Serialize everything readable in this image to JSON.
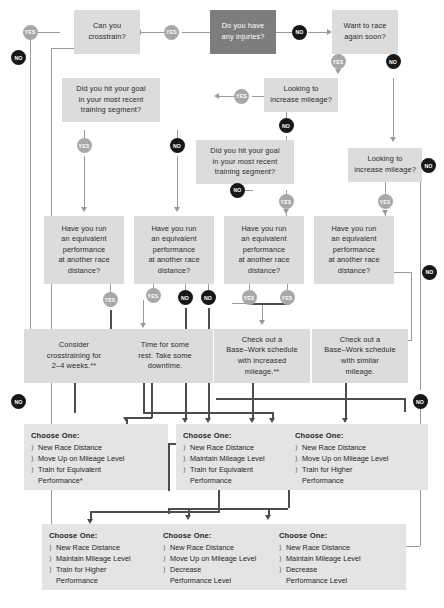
{
  "diagram": {
    "colors": {
      "node_bg": "#dcdcdc",
      "node_start_bg": "#7d7d7d",
      "card_bg": "#e4e4e4",
      "yes_badge": "#a8a8a8",
      "no_badge": "#171717",
      "connector_light": "#9a9a9a",
      "connector_dark": "#4d4d4d"
    },
    "labels": {
      "yes": "YES",
      "no": "NO",
      "bullet": "〉"
    },
    "nodes": [
      {
        "id": "injuries",
        "text": "Do you have\nany injuries?"
      },
      {
        "id": "crosstrain",
        "text": "Can you\ncrosstrain?"
      },
      {
        "id": "race_soon",
        "text": "Want to race\nagain soon?"
      },
      {
        "id": "mileage_a",
        "text": "Looking to\nincrease mileage?"
      },
      {
        "id": "mileage_b",
        "text": "Looking to\nincrease mileage?"
      },
      {
        "id": "goal_a",
        "text": "Did you hit your goal\nin your most recent\ntraining segment?"
      },
      {
        "id": "goal_b",
        "text": "Did you hit your goal\nin your most recent\ntraining segment?"
      },
      {
        "id": "equiv_1",
        "text": "Have you run\nan equivalent\nperformance\nat another race\ndistance?"
      },
      {
        "id": "equiv_2",
        "text": "Have you run\nan equivalent\nperformance\nat another race\ndistance?"
      },
      {
        "id": "equiv_3",
        "text": "Have you run\nan equivalent\nperformance\nat another race\ndistance?"
      },
      {
        "id": "equiv_4",
        "text": "Have you run\nan equivalent\nperformance\nat another race\ndistance?"
      },
      {
        "id": "consider_ct",
        "text": "Consider\ncrosstraining for\n2–4 weeks.**"
      },
      {
        "id": "rest",
        "text": "Time for some\nrest. Take some\ndowntime."
      },
      {
        "id": "base_inc",
        "text": "Check out a\nBase–Work schedule\nwith increased\nmileage.**"
      },
      {
        "id": "base_sim",
        "text": "Check out a\nBase–Work schedule\nwith similar\nmileage."
      }
    ],
    "cards": [
      {
        "id": "card_1",
        "heading": "Choose One:",
        "items": [
          "New Race Distance",
          "Move Up on Mileage Level",
          "Train for Equivalent\n Performance*"
        ]
      },
      {
        "id": "card_2",
        "heading": "Choose One:",
        "items": [
          "New Race Distance",
          "Maintain Mileage Level",
          "Train for Equivalent\n Performance"
        ]
      },
      {
        "id": "card_3",
        "heading": "Choose One:",
        "items": [
          "New Race Distance",
          "Move Up on Mileage Level",
          "Train for Higher\n Performance"
        ]
      },
      {
        "id": "card_4",
        "heading": "Choose One:",
        "items": [
          "New Race Distance",
          "Maintain Mileage Level",
          "Train for Higher\n Performance"
        ]
      },
      {
        "id": "card_5",
        "heading": "Choose One:",
        "items": [
          "New Race Distance",
          "Move Up on Mileage Level",
          "Decrease\n Performance Level"
        ]
      },
      {
        "id": "card_6",
        "heading": "Choose One:",
        "items": [
          "New Race Distance",
          "Move Up on Mileage Level",
          "Decrease\n Performance Level"
        ]
      },
      {
        "id": "card_7",
        "heading": "Choose One:",
        "items": [
          "New Race Distance",
          "Maintain Mileage Level",
          "Decrease\n Performance Level"
        ]
      }
    ],
    "badges": [
      {
        "id": "b_inj_yes",
        "kind": "YES"
      },
      {
        "id": "b_inj_no",
        "kind": "NO"
      },
      {
        "id": "b_ct_yes",
        "kind": "YES"
      },
      {
        "id": "b_ct_no",
        "kind": "NO"
      },
      {
        "id": "b_race_yes",
        "kind": "YES"
      },
      {
        "id": "b_race_no",
        "kind": "NO"
      },
      {
        "id": "b_mila_yes",
        "kind": "YES"
      },
      {
        "id": "b_mila_no",
        "kind": "NO"
      },
      {
        "id": "b_milb_yes",
        "kind": "YES"
      },
      {
        "id": "b_milb_no",
        "kind": "NO"
      },
      {
        "id": "b_goala_yes",
        "kind": "YES"
      },
      {
        "id": "b_goala_no",
        "kind": "NO"
      },
      {
        "id": "b_goalb_yes",
        "kind": "YES"
      },
      {
        "id": "b_goalb_no",
        "kind": "NO"
      },
      {
        "id": "b_eq1_yes",
        "kind": "YES"
      },
      {
        "id": "b_eq2_yes",
        "kind": "YES"
      },
      {
        "id": "b_eq2_no",
        "kind": "NO"
      },
      {
        "id": "b_eq3_no",
        "kind": "NO"
      },
      {
        "id": "b_eq3_yes",
        "kind": "YES"
      },
      {
        "id": "b_eq4_yes",
        "kind": "YES"
      },
      {
        "id": "b_eq4_no",
        "kind": "NO"
      },
      {
        "id": "b_left_no",
        "kind": "NO"
      },
      {
        "id": "b_right_no",
        "kind": "NO"
      }
    ]
  }
}
